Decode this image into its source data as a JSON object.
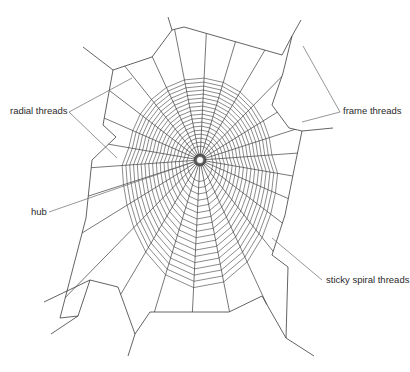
{
  "diagram": {
    "colors": {
      "background": "#ffffff",
      "web": "#3c3c3c",
      "leader": "#6a6a6a",
      "text": "#2a2a2a"
    },
    "hub": {
      "x": 200,
      "y": 160,
      "radius": 6
    },
    "labels": [
      {
        "id": "radial",
        "text": "radial threads",
        "x": 10,
        "y": 108,
        "anchor": [
          69,
          112
        ],
        "leaders": [
          [
            69,
            112,
            132,
            78
          ],
          [
            69,
            112,
            117,
            158
          ]
        ]
      },
      {
        "id": "frame",
        "text": "frame threads",
        "x": 343,
        "y": 108,
        "anchor": [
          340,
          112
        ],
        "leaders": [
          [
            340,
            112,
            303,
            46
          ],
          [
            340,
            112,
            302,
            122
          ]
        ]
      },
      {
        "id": "hub",
        "text": "hub",
        "x": 33,
        "y": 208,
        "anchor": [
          49,
          212
        ],
        "leaders": [
          [
            49,
            212,
            196,
            161
          ]
        ]
      },
      {
        "id": "sticky",
        "text": "sticky spiral threads",
        "x": 326,
        "y": 276,
        "anchor": [
          322,
          280
        ],
        "leaders": [
          [
            322,
            280,
            272,
            238
          ]
        ]
      }
    ],
    "frame_polygon": [
      [
        113,
        70
      ],
      [
        152,
        57
      ],
      [
        172,
        30
      ],
      [
        184,
        27
      ],
      [
        282,
        55
      ],
      [
        292,
        36
      ],
      [
        283,
        73
      ],
      [
        272,
        105
      ],
      [
        289,
        128
      ],
      [
        302,
        131
      ],
      [
        295,
        165
      ],
      [
        285,
        215
      ],
      [
        272,
        255
      ],
      [
        288,
        267
      ],
      [
        286,
        338
      ],
      [
        262,
        296
      ],
      [
        229,
        312
      ],
      [
        150,
        312
      ],
      [
        135,
        334
      ],
      [
        118,
        287
      ],
      [
        90,
        280
      ],
      [
        78,
        316
      ],
      [
        60,
        318
      ],
      [
        86,
        218
      ],
      [
        92,
        160
      ],
      [
        116,
        137
      ],
      [
        103,
        125
      ],
      [
        113,
        70
      ]
    ],
    "anchor_lines": [
      [
        [
          113,
          70
        ],
        [
          83,
          47
        ]
      ],
      [
        [
          172,
          30
        ],
        [
          168,
          17
        ]
      ],
      [
        [
          292,
          36
        ],
        [
          301,
          20
        ]
      ],
      [
        [
          302,
          131
        ],
        [
          333,
          128
        ]
      ],
      [
        [
          286,
          338
        ],
        [
          314,
          356
        ]
      ],
      [
        [
          78,
          316
        ],
        [
          51,
          334
        ]
      ],
      [
        [
          135,
          334
        ],
        [
          128,
          356
        ]
      ],
      [
        [
          90,
          280
        ],
        [
          44,
          302
        ]
      ]
    ],
    "radials": {
      "count": 26,
      "spiral_turns": 18,
      "spiral": {
        "cx": 200,
        "cy": 182,
        "rx_top": 72,
        "ry_top": 104,
        "ry_bottom": 110,
        "inner": 0.12
      }
    }
  }
}
